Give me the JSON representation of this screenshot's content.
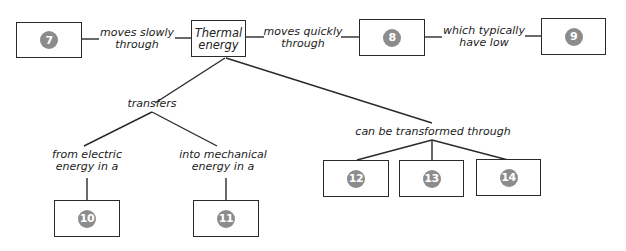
{
  "diagram": {
    "type": "concept-map",
    "central_concept": "Thermal energy",
    "central_lines": [
      "Thermal",
      "energy"
    ],
    "blanks": {
      "b7": "7",
      "b8": "8",
      "b9": "9",
      "b10": "10",
      "b11": "11",
      "b12": "12",
      "b13": "13",
      "b14": "14"
    },
    "links": {
      "slow": [
        "moves slowly",
        "through"
      ],
      "quick": [
        "moves quickly",
        "through"
      ],
      "low": [
        "which typically",
        "have low"
      ],
      "transfers": "transfers",
      "electric": [
        "from electric",
        "energy in a"
      ],
      "mechanical": [
        "into mechanical",
        "energy in a"
      ],
      "transformed": "can be transformed through"
    },
    "colors": {
      "line": "#2a2a2a",
      "badge": "#8c8c8c",
      "badge_text": "#ffffff"
    }
  }
}
